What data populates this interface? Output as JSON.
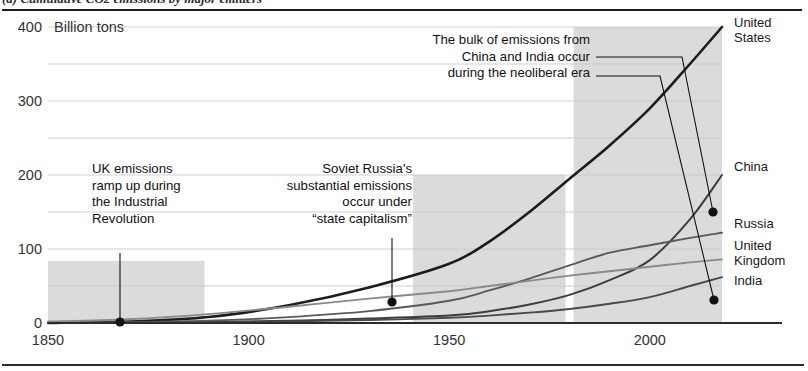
{
  "caption": {
    "text": "(a) Cumulative CO2 emissions by major emitters"
  },
  "chart_data": {
    "type": "line",
    "title": "",
    "subtitle": "",
    "unit_label": "Billion tons",
    "xlabel": "",
    "ylabel": "Billion tons",
    "xlim": [
      1850,
      2018
    ],
    "ylim": [
      0,
      400
    ],
    "xticks": [
      1850,
      1900,
      1950,
      2000
    ],
    "yticks": [
      0,
      100,
      200,
      300,
      400
    ],
    "ytick_labels": [
      "0",
      "100",
      "200",
      "300",
      "400"
    ],
    "xtick_labels": [
      "1850",
      "1900",
      "1950",
      "2000"
    ],
    "grid": "horizontal",
    "gridline_step": 50,
    "legend_position": "right-inline",
    "x": [
      1850,
      1870,
      1890,
      1910,
      1930,
      1950,
      1960,
      1970,
      1980,
      1990,
      2000,
      2010,
      2018
    ],
    "series": [
      {
        "name": "United States",
        "label": "United States",
        "color": "#1c1c1c",
        "width": 2.6,
        "label_y": 400,
        "values": [
          0,
          2,
          8,
          24,
          48,
          80,
          110,
          150,
          195,
          240,
          290,
          350,
          400
        ]
      },
      {
        "name": "China",
        "label": "China",
        "color": "#3d3d3d",
        "width": 2.0,
        "label_y": 205,
        "values": [
          0,
          0.5,
          1.5,
          3,
          6,
          10,
          16,
          25,
          38,
          58,
          85,
          140,
          200
        ]
      },
      {
        "name": "Russia",
        "label": "Russia",
        "color": "#5a5a5a",
        "width": 1.9,
        "label_y": 128,
        "values": [
          0,
          1,
          3,
          8,
          16,
          30,
          44,
          60,
          78,
          95,
          105,
          115,
          122
        ]
      },
      {
        "name": "United Kingdom",
        "label": "United Kingdom",
        "color": "#8a8a8a",
        "width": 1.9,
        "label_y": 98,
        "values": [
          2,
          5,
          12,
          22,
          33,
          43,
          50,
          57,
          64,
          70,
          76,
          82,
          86
        ]
      },
      {
        "name": "India",
        "label": "India",
        "color": "#4a4a4a",
        "width": 1.9,
        "label_y": 52,
        "values": [
          0,
          0.2,
          0.7,
          2,
          4,
          7,
          10,
          14,
          19,
          26,
          35,
          50,
          62
        ]
      }
    ],
    "bands": [
      {
        "name": "industrial-revolution-band",
        "x0": 1850,
        "x1": 1889,
        "y0": 0,
        "y1": 84
      },
      {
        "name": "state-capitalism-band",
        "x0": 1941,
        "x1": 1979,
        "y0": 0,
        "y1": 200
      },
      {
        "name": "neoliberal-era-band",
        "x0": 1981,
        "x1": 2018,
        "y0": 0,
        "y1": 400
      }
    ],
    "annotations": [
      {
        "id": "uk-industrial-revolution",
        "lines": [
          "UK emissions",
          "ramp up during",
          "the Industrial",
          "Revolution"
        ],
        "align": "start",
        "text_x": 92,
        "text_y": 173,
        "leader": {
          "x": 120,
          "y1": 253,
          "y2": 322
        },
        "point": {
          "x": 120,
          "y": 322
        }
      },
      {
        "id": "soviet-state-capitalism",
        "lines": [
          "Soviet Russia's",
          "substantial emissions",
          "occur under",
          "“state capitalism”"
        ],
        "align": "end",
        "text_x": 412,
        "text_y": 173,
        "leader": {
          "x": 392,
          "y1": 238,
          "y2": 302
        },
        "point": {
          "x": 392,
          "y": 302
        }
      },
      {
        "id": "china-india-neoliberal",
        "lines": [
          "The bulk of emissions from",
          "China and India occur",
          "during the neoliberal era"
        ],
        "align": "end",
        "text_x": 590,
        "text_y": 44,
        "elbows": [
          {
            "name": "china-leader",
            "from_x": 596,
            "from_y": 57,
            "mid_x": 682,
            "to_x": 713,
            "to_y": 212
          },
          {
            "name": "india-leader",
            "from_x": 596,
            "from_y": 76,
            "mid_x": 660,
            "to_x": 714,
            "to_y": 300
          }
        ],
        "points": [
          {
            "name": "china-point",
            "x": 713,
            "y": 212
          },
          {
            "name": "india-point",
            "x": 714,
            "y": 300
          }
        ]
      }
    ]
  },
  "geometry": {
    "plot_left": 48,
    "plot_right": 722,
    "plot_top": 27,
    "plot_bottom": 323
  }
}
